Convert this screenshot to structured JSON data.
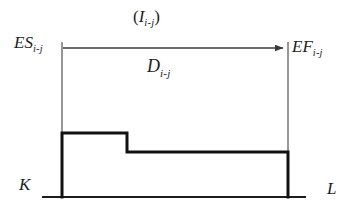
{
  "figure": {
    "kind": "activity-time-diagram",
    "background_color": "#ffffff",
    "line_color": "#1c1c1c",
    "labels": {
      "early_start": {
        "base": "ES",
        "subscript": "i-j"
      },
      "early_finish": {
        "base": "EF",
        "subscript": "i-j"
      },
      "interval": {
        "open_paren": "(",
        "base": "I",
        "subscript": "i-j",
        "close_paren": ")"
      },
      "duration": {
        "base": "D",
        "subscript": "i-j"
      },
      "left_node": "K",
      "right_node": "L"
    },
    "geometry": {
      "baseline_y": 197,
      "baseline_x1": 42,
      "baseline_x2": 306,
      "left_vertical_x": 62,
      "right_vertical_x": 288,
      "vertical_top_y": 42,
      "arrow_y": 48,
      "arrow_x1": 63,
      "arrow_x2": 285,
      "step_top_y": 133,
      "step_drop_x": 127,
      "step_lower_y": 152
    }
  }
}
